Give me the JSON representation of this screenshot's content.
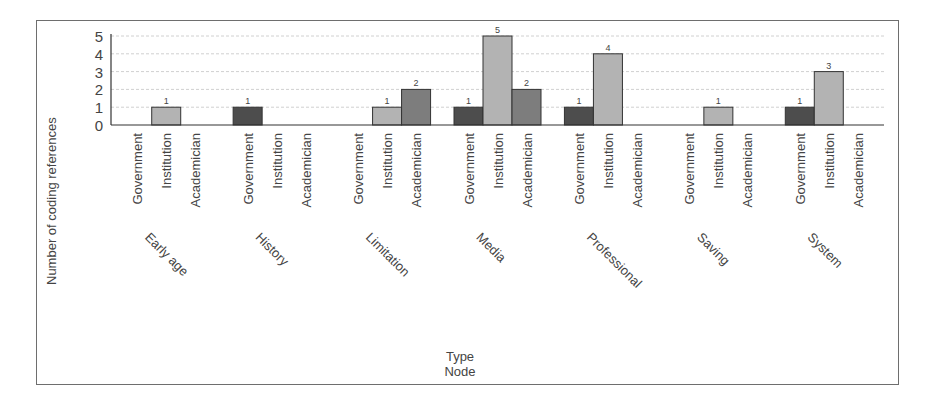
{
  "chart_data": {
    "type": "bar",
    "title": "",
    "xlabel": "Type\nNode",
    "xlabel_lines": [
      "Type",
      "Node"
    ],
    "ylabel": "Number of coding references",
    "ylim": [
      0,
      5
    ],
    "yticks": [
      0,
      1,
      2,
      3,
      4,
      5
    ],
    "grid": true,
    "legend": null,
    "groups": [
      "Early age",
      "History",
      "Limitation",
      "Media",
      "Professional",
      "Saving",
      "System"
    ],
    "types": [
      "Government",
      "Institution",
      "Academician"
    ],
    "series": [
      {
        "name": "Government",
        "color": "#4d4d4d",
        "values": [
          0,
          1,
          0,
          1,
          1,
          0,
          1
        ]
      },
      {
        "name": "Institution",
        "color": "#b3b3b3",
        "values": [
          1,
          0,
          1,
          5,
          4,
          1,
          3
        ]
      },
      {
        "name": "Academician",
        "color": "#7d7d7d",
        "values": [
          0,
          0,
          2,
          2,
          0,
          0,
          0
        ]
      }
    ],
    "data_labels": true
  }
}
